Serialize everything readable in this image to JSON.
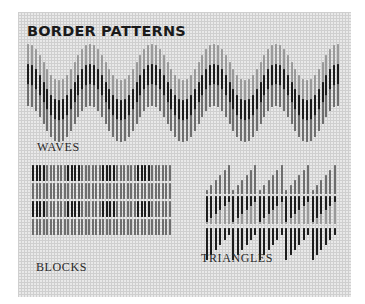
{
  "title": "BORDER PATTERNS",
  "labels": {
    "waves": "WAVES",
    "blocks": "BLOCKS",
    "triangles": "TRIANGLES"
  },
  "colors": {
    "dark": "#1c1c1c",
    "mid": "#6e6e6e",
    "light": "#9a9a9a",
    "background": "#e9e9e9",
    "grid": "#cfcfcf"
  },
  "patterns": [
    {
      "name": "waves",
      "periods": 5,
      "period_width": 62,
      "columns_per_period": 16
    },
    {
      "name": "blocks",
      "rows": 4,
      "block_groups": 4,
      "dark_per_group": 4,
      "light_per_group": 6
    },
    {
      "name": "triangles",
      "teeth": 5,
      "columns_per_tooth": 6
    }
  ]
}
